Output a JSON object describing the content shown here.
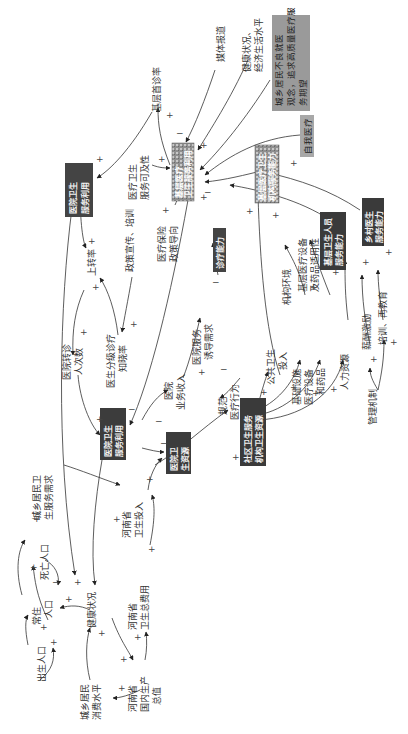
{
  "diagram": {
    "type": "causal-loop-diagram",
    "orientation": "rotated-90-ccw",
    "colors": {
      "dark_box": "#3a3a3a",
      "grey_box": "#9a9a9a",
      "texture_box": "#8c8c8c",
      "line": "#333333",
      "text": "#333333"
    },
    "nodes": {
      "jiceng_shouzhen": "基层首诊率",
      "meiti_baodao": "媒体报道",
      "jiankang_jingji": [
        "健康状况、",
        "经济生活水平"
      ],
      "guannian": [
        "城乡居民不良就医",
        "观念，追求高质量医疗服",
        "务期望"
      ],
      "zifu_yiliao": "自我医疗",
      "yiliao_kejixing": [
        "医疗卫生",
        "服务可及性"
      ],
      "zhengce_xuanchuan": "政策宣传、培训",
      "yibao_zhengce": [
        "医疗保险",
        "政策导向"
      ],
      "shangzhuan_lv": "上转率",
      "yiyuan_zhuanzhen": [
        "医院转诊",
        "人次数"
      ],
      "fenji_zhixiao": [
        "医生分级诊疗",
        "知晓率"
      ],
      "yiyuan_shouru": [
        "医院",
        "业务收入"
      ],
      "yiyuan_youdao": [
        "医院服务",
        "诱导需求"
      ],
      "guifan_xingwei": [
        "规范",
        "医疗行为"
      ],
      "gonggong_touru": [
        "公共卫生",
        "投入"
      ],
      "jigou_huanjing": "机构环境",
      "jiceng_shebei": [
        "基层医疗设备",
        "及药品适用性"
      ],
      "jichu_sheshi": [
        "基础设施",
        "医疗设备",
        "和药品"
      ],
      "renli_ziyuan": "人力资源",
      "xinchou_jili": "薪酬激励",
      "peixun": "培训、再教育",
      "guanli_jizhi": "管理机制",
      "chengxiang_xuqiu": [
        "城乡居民卫",
        "生服务需求"
      ],
      "siwang_renkou": "死亡人口",
      "changzhu_renkou": [
        "常住",
        "人口"
      ],
      "chusheng_renkou": "出生人口",
      "jiankang_zhuangkuang": "健康状况",
      "henan_touru": [
        "河南省",
        "卫生投入"
      ],
      "henan_zongfeiyong": [
        "河南省",
        "卫生总费用"
      ],
      "henan_gdp": [
        "河南省",
        "国内生产",
        "总值"
      ],
      "xiaofei_shuiping": [
        "城乡居民",
        "消费水平"
      ]
    },
    "boxes": {
      "jiceng_fuwu": [
        "基层医疗",
        "卫生服务利用"
      ],
      "yiyuan_fuwu": [
        "医院卫生",
        "服务利用"
      ],
      "yiyuan_ziyuan": [
        "医院卫",
        "生资源"
      ],
      "jiceng_ziyuan": [
        "社区卫生服务",
        "机构卫生资源"
      ],
      "xiangzhen_ziyuan": [
        "乡镇卫生院",
        "卫生资源"
      ],
      "cun_ziyuan": [
        "村卫生室",
        "卫生资源"
      ],
      "cunyi": [
        "乡村医生",
        "服务能力"
      ],
      "jiceng_nengli": [
        "基层医疗卫生",
        "机构服务能力"
      ],
      "zhenliao_nengli": "诊疗能力",
      "jiceng_renyuan": [
        "基层卫生人员",
        "服务能力"
      ]
    },
    "signs": {
      "plus": "+",
      "minus": "−"
    }
  }
}
